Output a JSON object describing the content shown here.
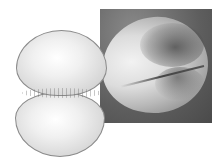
{
  "figure": {
    "illustration": {
      "label": "dividing-cell-drawing"
    },
    "micrograph": {
      "label": "cell-furrow-micrograph"
    }
  },
  "colors": {
    "background": "#ffffff",
    "micrograph_bg": "#5e5e5e",
    "cell_light": "#f0f0f0",
    "cell_edge": "#8a8a8a"
  }
}
